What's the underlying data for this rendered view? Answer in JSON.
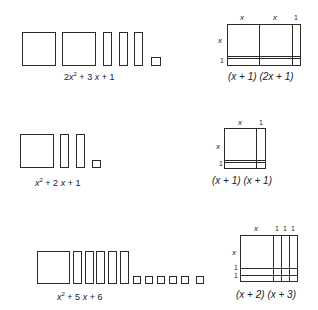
{
  "rows": [
    {
      "polynomial": "2x² + 3x + 1",
      "poly_parts": {
        "a": "2",
        "b": "3",
        "c": "1"
      },
      "factored": "(x + 1) (2x + 1)",
      "top_labels": [
        "x",
        "x",
        "1"
      ],
      "side_labels": [
        "x",
        "1"
      ]
    },
    {
      "polynomial": "x² + 2x + 1",
      "poly_parts": {
        "b": "2",
        "c": "1"
      },
      "factored": "(x + 1) (x + 1)",
      "top_labels": [
        "x",
        "1"
      ],
      "side_labels": [
        "x",
        "1"
      ]
    },
    {
      "polynomial": "x² + 5x + 6",
      "poly_parts": {
        "b": "5",
        "c": "6"
      },
      "factored": "(x + 2) (x + 3)",
      "top_labels": [
        "x",
        "1",
        "1",
        "1"
      ],
      "side_labels": [
        "x",
        "1",
        "1"
      ]
    }
  ]
}
